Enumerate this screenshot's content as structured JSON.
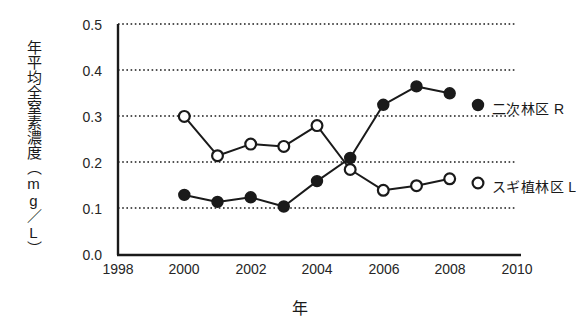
{
  "chart_data": {
    "type": "line",
    "title": "",
    "xlabel": "年",
    "ylabel": "年平均全窒素濃度（mg／L）",
    "xlim": [
      1998,
      2010
    ],
    "ylim": [
      0.0,
      0.5
    ],
    "xticks": [
      "1998",
      "2000",
      "2002",
      "2004",
      "2006",
      "2008",
      "2010"
    ],
    "yticks": [
      "0.0",
      "0.1",
      "0.2",
      "0.3",
      "0.4",
      "0.5"
    ],
    "grid": "horizontal-dotted",
    "legend_position": "right-inline",
    "x": [
      2000,
      2001,
      2002,
      2003,
      2004,
      2005,
      2006,
      2007,
      2008
    ],
    "series": [
      {
        "name": "二次林区 R",
        "marker": "filled-circle",
        "color": "#1a1a1a",
        "values": [
          0.13,
          0.115,
          0.125,
          0.105,
          0.16,
          0.21,
          0.325,
          0.365,
          0.35
        ]
      },
      {
        "name": "スギ植林区 L",
        "marker": "open-circle",
        "color": "#1a1a1a",
        "values": [
          0.3,
          0.215,
          0.24,
          0.235,
          0.28,
          0.185,
          0.14,
          0.15,
          0.165
        ]
      }
    ]
  },
  "axis": {
    "y_label": "年平均全窒素濃度（mg／L）",
    "x_label": "年",
    "y_ticks": [
      "0.5",
      "0.4",
      "0.3",
      "0.2",
      "0.1",
      "0.0"
    ],
    "x_ticks": [
      "1998",
      "2000",
      "2002",
      "2004",
      "2006",
      "2008",
      "2010"
    ]
  },
  "legend": {
    "secondary_forest": "二次林区 R",
    "cedar_plantation": "スギ植林区 L"
  }
}
